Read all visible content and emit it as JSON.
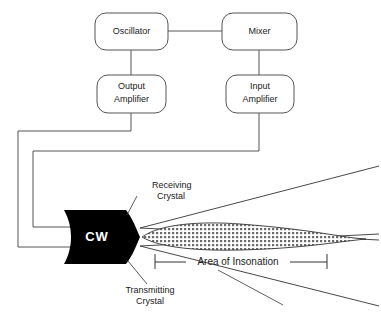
{
  "diagram": {
    "blocks": [
      {
        "id": "oscillator",
        "label": "Oscillator"
      },
      {
        "id": "mixer",
        "label": "Mixer"
      },
      {
        "id": "output-amplifier",
        "label_line1": "Output",
        "label_line2": "Amplifier"
      },
      {
        "id": "input-amplifier",
        "label_line1": "Input",
        "label_line2": "Amplifier"
      }
    ],
    "transducer": {
      "label": "CW"
    },
    "annotations": [
      {
        "id": "receiving-crystal",
        "line1": "Receiving",
        "line2": "Crystal"
      },
      {
        "id": "transmitting-crystal",
        "line1": "Transmitting",
        "line2": "Crystal"
      }
    ],
    "dimension": {
      "label": "Area of Insonation"
    },
    "colors": {
      "background": "#ffffff",
      "box_stroke": "#555555",
      "wire": "#555555",
      "beam": "#333333",
      "transducer_fill": "#000000",
      "transducer_text": "#ffffff",
      "text": "#222222"
    }
  }
}
